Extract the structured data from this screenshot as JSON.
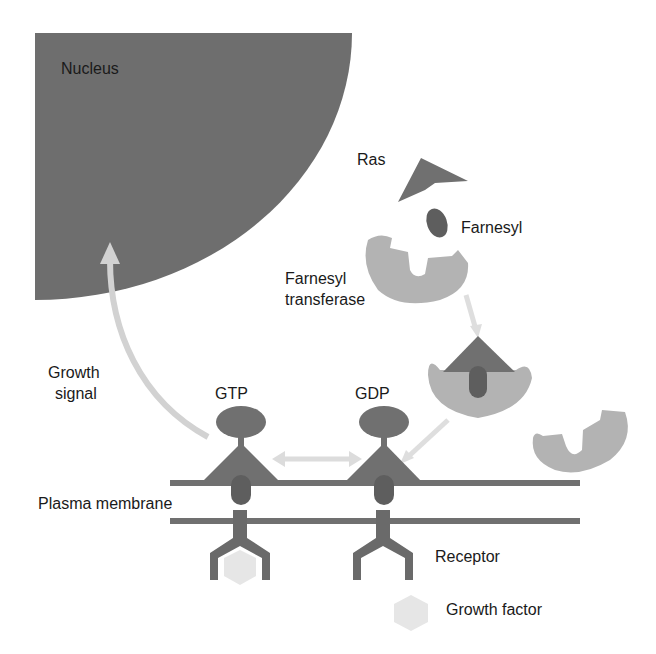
{
  "labels": {
    "nucleus": "Nucleus",
    "ras": "Ras",
    "farnesyl": "Farnesyl",
    "farnesyl_transferase_line1": "Farnesyl",
    "farnesyl_transferase_line2": "transferase",
    "growth_signal_line1": "Growth",
    "growth_signal_line2": "signal",
    "gtp": "GTP",
    "gdp": "GDP",
    "plasma_membrane": "Plasma membrane",
    "receptor": "Receptor",
    "growth_factor": "Growth factor"
  },
  "colors": {
    "nucleus": "#6e6e6e",
    "ras": "#707070",
    "farnesyl": "#5e5e5e",
    "transferase": "#b3b3b3",
    "membrane": "#707070",
    "arrow": "#d2d2d2",
    "growth_factor": "#e6e6e6",
    "text": "#1a1a1a"
  }
}
